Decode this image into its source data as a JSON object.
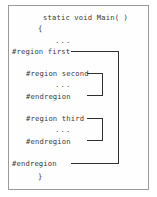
{
  "figure": {
    "background_color": "#ffffff",
    "frame_color": "#9a9a9a",
    "text_color": "#3a3a3a",
    "bracket_color": "#2f2f2f"
  },
  "code": {
    "lines": [
      {
        "text": "static void Main( )",
        "indent": "method-signature"
      },
      {
        "text": "{",
        "indent": "method-open-brace"
      },
      {
        "text": "...",
        "indent": "method-body-ellipsis"
      },
      {
        "text": "#region first",
        "indent": "outer-region-start"
      },
      {
        "text": "#region second",
        "indent": "inner-region-second-start"
      },
      {
        "text": "...",
        "indent": "inner-second-ellipsis"
      },
      {
        "text": "#endregion",
        "indent": "inner-region-second-end"
      },
      {
        "text": "#region third",
        "indent": "inner-region-third-start"
      },
      {
        "text": "...",
        "indent": "inner-third-ellipsis"
      },
      {
        "text": "#endregion",
        "indent": "inner-region-third-end"
      },
      {
        "text": "#endregion",
        "indent": "outer-region-end"
      },
      {
        "text": "}",
        "indent": "method-close-brace"
      }
    ],
    "signature": "static void Main( )",
    "open_brace": "{",
    "close_brace": "}",
    "ellipsis": "...",
    "outer_region_start": "#region first",
    "outer_region_end": "#endregion",
    "second_region_start": "#region second",
    "second_region_end": "#endregion",
    "third_region_start": "#region third",
    "third_region_end": "#endregion"
  },
  "brackets": {
    "outer": {
      "label": "first-region-span",
      "spans": "#region first to #endregion"
    },
    "second": {
      "label": "second-region-span",
      "spans": "#region second to #endregion"
    },
    "third": {
      "label": "third-region-span",
      "spans": "#region third to #endregion"
    }
  }
}
